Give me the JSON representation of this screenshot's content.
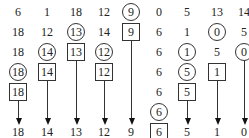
{
  "columns": [
    {
      "x": 18,
      "cells": [
        {
          "v": "6",
          "s": "plain"
        },
        {
          "v": "18",
          "s": "plain"
        },
        {
          "v": "18",
          "s": "plain"
        },
        {
          "v": "18",
          "s": "circle"
        },
        {
          "v": "18",
          "s": "box"
        }
      ],
      "line_from": 4,
      "output": "18"
    },
    {
      "x": 47,
      "cells": [
        {
          "v": "1",
          "s": "plain"
        },
        {
          "v": "12",
          "s": "plain"
        },
        {
          "v": "14",
          "s": "circle"
        },
        {
          "v": "14",
          "s": "box"
        }
      ],
      "line_from": 3,
      "output": "14"
    },
    {
      "x": 76,
      "cells": [
        {
          "v": "18",
          "s": "plain"
        },
        {
          "v": "13",
          "s": "circle"
        },
        {
          "v": "13",
          "s": "box"
        }
      ],
      "line_from": 2,
      "output": "13"
    },
    {
      "x": 104,
      "cells": [
        {
          "v": "12",
          "s": "plain"
        },
        {
          "v": "14",
          "s": "plain"
        },
        {
          "v": "12",
          "s": "circle"
        },
        {
          "v": "12",
          "s": "box"
        }
      ],
      "line_from": 3,
      "output": "12"
    },
    {
      "x": 131,
      "cells": [
        {
          "v": "9",
          "s": "circle"
        },
        {
          "v": "9",
          "s": "box"
        }
      ],
      "line_from": 1,
      "output": "9"
    },
    {
      "x": 159,
      "cells": [
        {
          "v": "0",
          "s": "plain"
        },
        {
          "v": "6",
          "s": "plain"
        },
        {
          "v": "6",
          "s": "plain"
        },
        {
          "v": "6",
          "s": "plain"
        },
        {
          "v": "6",
          "s": "plain"
        },
        {
          "v": "6",
          "s": "circle"
        },
        {
          "v": "6",
          "s": "box"
        }
      ],
      "line_from": null,
      "output": null
    },
    {
      "x": 187,
      "cells": [
        {
          "v": "5",
          "s": "plain"
        },
        {
          "v": "1",
          "s": "plain"
        },
        {
          "v": "1",
          "s": "circle"
        },
        {
          "v": "5",
          "s": "circle"
        },
        {
          "v": "5",
          "s": "box"
        }
      ],
      "line_from": 4,
      "output": "5"
    },
    {
      "x": 217,
      "cells": [
        {
          "v": "13",
          "s": "plain"
        },
        {
          "v": "0",
          "s": "circle"
        },
        {
          "v": "5",
          "s": "plain"
        },
        {
          "v": "1",
          "s": "box"
        }
      ],
      "line_from": 3,
      "output": "1"
    },
    {
      "x": 244,
      "cells": [
        {
          "v": "14",
          "s": "plain"
        },
        {
          "v": "5",
          "s": "plain"
        },
        {
          "v": "0",
          "s": "circle"
        }
      ],
      "line_from": 2,
      "output": "0"
    }
  ],
  "row_y": [
    12,
    32,
    52,
    72,
    92,
    112,
    132
  ],
  "colors": {
    "stroke": "#333333",
    "text": "#222222",
    "background": "#ffffff"
  }
}
